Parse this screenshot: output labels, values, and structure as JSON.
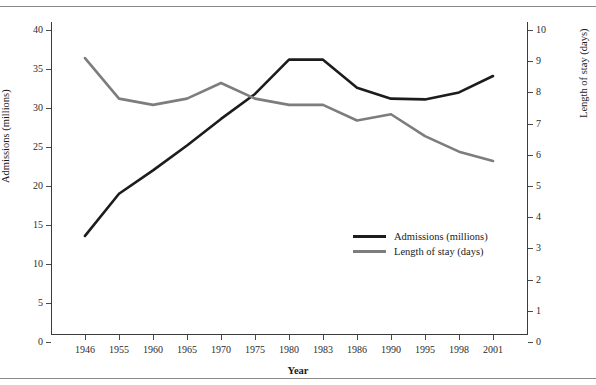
{
  "page": {
    "cutoff_header_text": "",
    "rules": [
      "top-rule",
      "bottom-rule"
    ]
  },
  "chart_data": {
    "type": "line",
    "title": "",
    "xlabel": "Year",
    "categories": [
      "1946",
      "1955",
      "1960",
      "1965",
      "1970",
      "1975",
      "1980",
      "1983",
      "1986",
      "1990",
      "1995",
      "1998",
      "2001"
    ],
    "grid": false,
    "legend_position": "center-right",
    "axes": {
      "left": {
        "label": "Admissions (millions)",
        "ylim": [
          0,
          40
        ],
        "ticks": [
          0,
          5,
          10,
          15,
          20,
          25,
          30,
          35,
          40
        ],
        "tick_labels": [
          "0",
          "5",
          "10",
          "15",
          "20",
          "25",
          "30",
          "35",
          "40"
        ]
      },
      "right": {
        "label": "Length of stay (days)",
        "ylim": [
          0,
          10
        ],
        "ticks": [
          0,
          1,
          2,
          3,
          4,
          5,
          6,
          7,
          8,
          9,
          10
        ],
        "tick_labels": [
          "0",
          "1",
          "2",
          "3",
          "4",
          "5",
          "6",
          "7",
          "8",
          "9",
          "10"
        ]
      }
    },
    "series": [
      {
        "name": "Admissions (millions)",
        "axis": "left",
        "color": "#1c1c1c",
        "width": 2.6,
        "values": [
          13.6,
          19.0,
          22.0,
          25.2,
          28.6,
          31.8,
          36.2,
          36.2,
          32.6,
          31.2,
          31.1,
          32.0,
          34.1
        ]
      },
      {
        "name": "Length of stay (days)",
        "axis": "right",
        "color": "#7d7d7d",
        "width": 2.6,
        "values": [
          9.1,
          7.8,
          7.6,
          7.8,
          8.3,
          7.8,
          7.6,
          7.6,
          7.1,
          7.3,
          6.6,
          6.1,
          5.8
        ]
      }
    ],
    "legend": [
      {
        "label": "Admissions (millions)",
        "color": "#1c1c1c"
      },
      {
        "label": "Length of stay (days)",
        "color": "#7d7d7d"
      }
    ]
  }
}
